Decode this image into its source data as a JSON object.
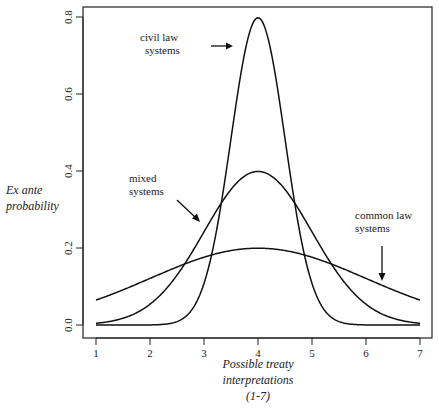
{
  "chart_data": {
    "type": "line",
    "title": "",
    "xlabel": [
      "Possible treaty",
      "interpretations",
      "(1-7)"
    ],
    "ylabel": [
      "Ex ante",
      "probability"
    ],
    "xlim": [
      1,
      7
    ],
    "ylim": [
      0,
      0.8
    ],
    "x_ticks": [
      "1",
      "2",
      "3",
      "4",
      "5",
      "6",
      "7"
    ],
    "y_ticks": [
      "0.0",
      "0.2",
      "0.4",
      "0.6",
      "0.8"
    ],
    "grid": false,
    "legend": "none (inline annotations with arrows)",
    "series": [
      {
        "name": "civil law systems",
        "distribution": "normal",
        "mean": 4,
        "sd": 0.5,
        "peak": 0.8,
        "x": [
          1,
          2,
          2.5,
          3,
          3.5,
          4,
          4.5,
          5,
          5.5,
          6,
          7
        ],
        "values": [
          0.0,
          0.0,
          0.0,
          0.11,
          0.48,
          0.8,
          0.48,
          0.11,
          0.0,
          0.0,
          0.0
        ]
      },
      {
        "name": "mixed systems",
        "distribution": "normal",
        "mean": 4,
        "sd": 1.0,
        "peak": 0.4,
        "x": [
          1,
          2,
          3,
          4,
          5,
          6,
          7
        ],
        "values": [
          0.004,
          0.054,
          0.242,
          0.399,
          0.242,
          0.054,
          0.004
        ]
      },
      {
        "name": "common law systems",
        "distribution": "normal",
        "mean": 4,
        "sd": 2.0,
        "peak": 0.2,
        "x": [
          1,
          2,
          3,
          4,
          5,
          6,
          7
        ],
        "values": [
          0.065,
          0.121,
          0.176,
          0.199,
          0.176,
          0.121,
          0.065
        ]
      }
    ],
    "annotations": [
      {
        "label": [
          "civil law",
          "systems"
        ],
        "arrow": "right, pointing at civil law peak"
      },
      {
        "label": [
          "mixed",
          "systems"
        ],
        "arrow": "down-right, pointing at mixed curve"
      },
      {
        "label": [
          "common law",
          "systems"
        ],
        "arrow": "down, pointing at common law curve"
      }
    ]
  }
}
